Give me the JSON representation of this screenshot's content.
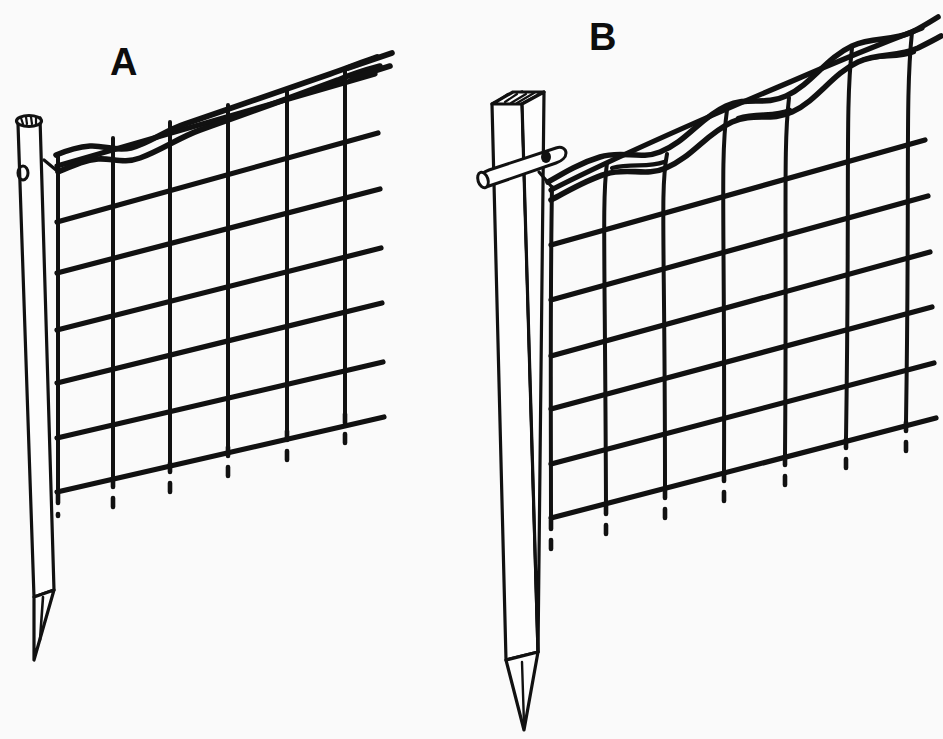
{
  "figure": {
    "background_color": "#fafafa",
    "ink_color": "#111111",
    "width": 943,
    "height": 739
  },
  "panels": [
    {
      "id": "panel-a",
      "label": "A",
      "label_x": 110,
      "label_y": 75,
      "description": "Round steel fence post with capped top and eyelet hole; wire mesh pulled taut and attached at post, top tension wire straight",
      "post": {
        "type": "round-steel-post",
        "top_cap": "rounded-cap-with-hatching",
        "eyelet": "single-hole-near-top",
        "tip": "pointed-driven-tip",
        "top_y": 112,
        "bottom_y": 652
      },
      "mesh": {
        "state": "taut",
        "horizontal_wires": 7,
        "vertical_wires": 6,
        "bottom_stubs": 6,
        "top_wire": "straight-tension-wire"
      }
    },
    {
      "id": "panel-b",
      "label": "B",
      "label_x": 589,
      "label_y": 50,
      "description": "Square wooden fence post with rod through it; wire mesh slack and wavy, top tension wire sagging between verticals",
      "post": {
        "type": "square-wooden-post",
        "top_cap": "square-end-with-hatching",
        "through_rod": "cylindrical-rod-through-post",
        "tip": "pointed-driven-tip",
        "top_y": 90,
        "bottom_y": 720
      },
      "mesh": {
        "state": "slack",
        "horizontal_wires": 7,
        "vertical_wires": 7,
        "bottom_stubs": 7,
        "top_wire": "sagging-wavy-tension-wire"
      }
    }
  ],
  "legend": {
    "line_style_solid": "wire-mesh-strand",
    "line_style_dashed": "wire-end-below-bottom-strand"
  }
}
